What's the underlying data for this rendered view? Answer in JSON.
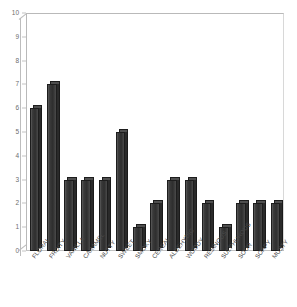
{
  "chart_data": {
    "type": "bar",
    "title": "",
    "xlabel": "",
    "ylabel": "",
    "ylim": [
      0,
      10
    ],
    "yticks": [
      0,
      1,
      2,
      3,
      4,
      5,
      6,
      7,
      8,
      9,
      10
    ],
    "grid": false,
    "legend": false,
    "bar_color": "#333333",
    "categories": [
      "FLORAL",
      "FRUITY",
      "VANILLA",
      "CARAMEL",
      "NUTTY",
      "SWEET",
      "SMOKY",
      "CEREAL",
      "ALDEHYDIC",
      "WOODY",
      "RESINOUS",
      "SULPHUROUS",
      "SOUR",
      "SOAPY",
      "MUSTY"
    ],
    "values": [
      6,
      7,
      3,
      3,
      3,
      5,
      1,
      2,
      3,
      3,
      2,
      1,
      2,
      2,
      2
    ]
  },
  "axes": {
    "y_tick_labels": [
      "10",
      "9",
      "8",
      "7",
      "6",
      "5",
      "4",
      "3",
      "2",
      "1",
      "0"
    ]
  }
}
